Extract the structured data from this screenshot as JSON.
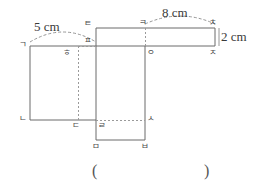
{
  "figure": {
    "stroke_color": "#6b6b6b",
    "dash_color": "#9a9a9a",
    "text_color": "#3a3a3a",
    "background": "#ffffff"
  },
  "dimensions": [
    {
      "id": "width-5cm",
      "text": "5 cm",
      "value": 5,
      "unit": "cm"
    },
    {
      "id": "width-8cm",
      "text": "8 cm",
      "value": 8,
      "unit": "cm"
    },
    {
      "id": "height-2cm",
      "text": "2 cm",
      "value": 2,
      "unit": "cm"
    }
  ],
  "vertices": [
    {
      "id": "giyeok",
      "text": "ㄱ"
    },
    {
      "id": "nieun",
      "text": "ㄴ"
    },
    {
      "id": "digeut",
      "text": "ㄷ"
    },
    {
      "id": "rieul",
      "text": "ㄹ"
    },
    {
      "id": "mieum",
      "text": "ㅁ"
    },
    {
      "id": "bieup",
      "text": "ㅂ"
    },
    {
      "id": "siot",
      "text": "ㅅ"
    },
    {
      "id": "ieung",
      "text": "ㅇ"
    },
    {
      "id": "jieut",
      "text": "ㅈ"
    },
    {
      "id": "chieut",
      "text": "ㅊ"
    },
    {
      "id": "kieuk",
      "text": "ㅋ"
    },
    {
      "id": "tieut",
      "text": "ㅌ"
    },
    {
      "id": "pieup",
      "text": "ㅍ"
    },
    {
      "id": "hieut",
      "text": "ㅎ"
    }
  ],
  "answer_blank": {
    "open_paren": "(",
    "close_paren": ")",
    "value": ""
  }
}
